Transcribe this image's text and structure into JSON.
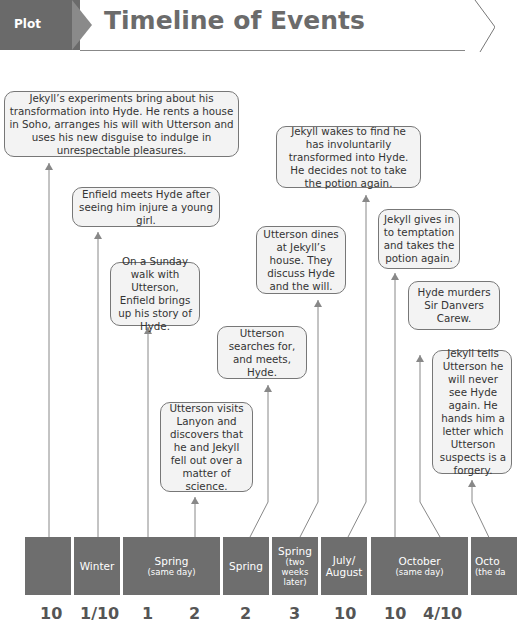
{
  "header": {
    "section_tab": "Plot",
    "title": "Timeline of Events"
  },
  "events": [
    {
      "text": "Jekyll’s experiments bring about his transformation into Hyde. He rents a house in Soho, arranges his will with Utterson and uses his new disguise to indulge in unrespectable pleasures."
    },
    {
      "text": "Enfield meets Hyde after seeing him injure a young girl."
    },
    {
      "text": "On a Sunday walk with Utterson, Enfield brings up his story of Hyde."
    },
    {
      "text": "Utterson visits Lanyon and discovers that he and Jekyll fell out over a matter of science."
    },
    {
      "text": "Utterson searches for, and meets, Hyde."
    },
    {
      "text": "Utterson dines at Jekyll’s house. They discuss Hyde and the will."
    },
    {
      "text": "Jekyll wakes to find he has involuntarily transformed into Hyde. He decides not to take the potion again."
    },
    {
      "text": "Jekyll gives in to temptation and takes the potion again."
    },
    {
      "text": "Hyde murders Sir Danvers Carew."
    },
    {
      "text": "Jekyll tells Utterson he will never see Hyde again. He hands him a letter which Utterson suspects is a forgery."
    }
  ],
  "periods": [
    {
      "label": "",
      "sub": ""
    },
    {
      "label": "Winter",
      "sub": ""
    },
    {
      "label": "Spring",
      "sub": "(same day)"
    },
    {
      "label": "Spring",
      "sub": ""
    },
    {
      "label": "Spring",
      "sub": "(two weeks later)"
    },
    {
      "label": "July/ August",
      "sub": ""
    },
    {
      "label": "October",
      "sub": "(same day)"
    },
    {
      "label": "Octo",
      "sub": "(the da"
    }
  ],
  "chapters": [
    "10",
    "1/10",
    "1",
    "2",
    "2",
    "3",
    "10",
    "10",
    "4/10"
  ]
}
